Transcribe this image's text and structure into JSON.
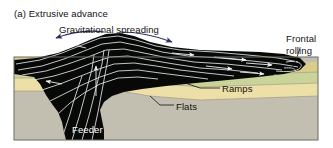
{
  "figure": {
    "caption": "(a) Extrusive advance",
    "background_color": "#ffffff"
  },
  "labels": {
    "gravitational_spreading": "Gravitational spreading",
    "frontal_rolling": "Frontal\nrolling",
    "ramps": "Ramps",
    "flats": "Flats",
    "feeder": "Feeder"
  },
  "colors": {
    "salt_body": "#080806",
    "layer_khaki": "#d8cd8a",
    "layer_green": "#c9d39a",
    "layer_cream": "#ecdfa8",
    "layer_basement": "#c3bfb0",
    "flow_line": "#e8f0f2",
    "spreading_arrow": "#2b2f5e",
    "leader_line": "#111111",
    "section_border": "#6b6a60",
    "label_text": "#111111",
    "feeder_text": "#ffffff"
  },
  "section": {
    "left": 14,
    "right": 318,
    "top": 57,
    "bottom": 140,
    "layer_order": [
      "khaki",
      "green",
      "cream",
      "basement"
    ]
  },
  "diagram": {
    "type": "geological-cross-section",
    "features": [
      "gravitational spreading dome",
      "frontal rolling nose",
      "ramps",
      "flats",
      "feeder stem"
    ],
    "flow_direction": "outward from feeder, dominantly to the right"
  }
}
